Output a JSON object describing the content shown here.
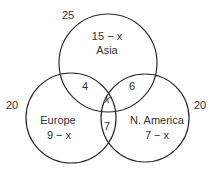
{
  "diagram": {
    "type": "venn",
    "sets": [
      {
        "name": "Asia",
        "total": "25",
        "only": "15 − x"
      },
      {
        "name": "Europe",
        "total": "20",
        "only": "9 − x"
      },
      {
        "name": "N. America",
        "total": "20",
        "only": "7 − x"
      }
    ],
    "intersections": {
      "asia_europe": "4",
      "asia_namerica": "6",
      "europe_namerica": "7",
      "all_three": "x"
    },
    "stroke_color": "#2b2b2b"
  }
}
